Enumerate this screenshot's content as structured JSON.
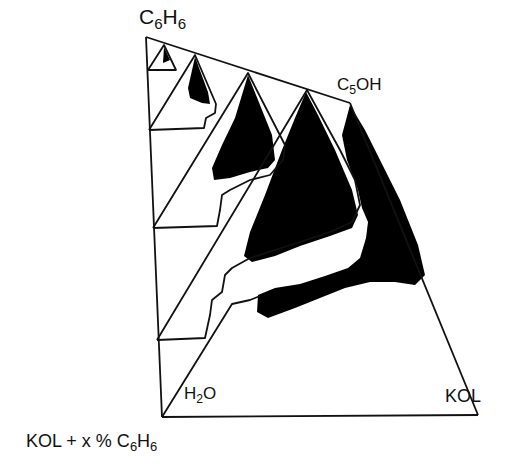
{
  "figure": {
    "type": "stacked pseudo-ternary phase diagram",
    "colors": {
      "line": "#111111",
      "fill": "#000000",
      "background": "#ffffff"
    }
  },
  "labels": {
    "top_vertex": {
      "main": "C",
      "sub1": "6",
      "mid": "H",
      "sub2": "6"
    },
    "right_top_vertex": {
      "main": "C",
      "sub1": "5",
      "rest": "OH"
    },
    "left_base_vertex": {
      "main": "H",
      "sub1": "2",
      "rest": "O"
    },
    "right_base_vertex": "KOL",
    "axis_label": {
      "prefix": "KOL + x % C",
      "sub1": "6",
      "mid": "H",
      "sub2": "6"
    }
  },
  "triangles": [
    {
      "name": "ternary-0",
      "apex": [
        164,
        45
      ],
      "left": [
        148,
        70
      ],
      "right": [
        185,
        70
      ]
    },
    {
      "name": "ternary-1",
      "apex": [
        195,
        55
      ],
      "left": [
        151,
        130
      ],
      "right": [
        232,
        128
      ]
    },
    {
      "name": "ternary-2",
      "apex": [
        248,
        73
      ],
      "left": [
        153,
        228
      ],
      "right": [
        290,
        225
      ]
    },
    {
      "name": "ternary-3",
      "apex": [
        307,
        90
      ],
      "left": [
        158,
        340
      ],
      "right": [
        345,
        335
      ]
    },
    {
      "name": "ternary-4",
      "apex": [
        350,
        103
      ],
      "left": [
        162,
        417
      ],
      "right": [
        478,
        415
      ]
    }
  ]
}
